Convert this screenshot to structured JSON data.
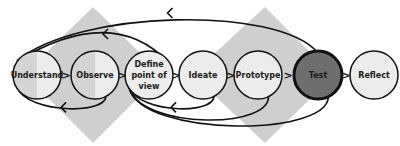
{
  "diagram": {
    "title": "",
    "steps": [
      {
        "id": "understand",
        "lines": [
          "Understand"
        ],
        "highlighted": false
      },
      {
        "id": "observe",
        "lines": [
          "Observe"
        ],
        "highlighted": false
      },
      {
        "id": "define",
        "lines": [
          "Define",
          "point of",
          "view"
        ],
        "highlighted": false
      },
      {
        "id": "ideate",
        "lines": [
          "Ideate"
        ],
        "highlighted": false
      },
      {
        "id": "prototype",
        "lines": [
          "Prototype"
        ],
        "highlighted": false
      },
      {
        "id": "test",
        "lines": [
          "Test"
        ],
        "highlighted": true
      },
      {
        "id": "reflect",
        "lines": [
          "Reflect"
        ],
        "highlighted": false
      }
    ],
    "separator_glyph": ">",
    "colors": {
      "diamond": "#cfcfcf",
      "circle_fill": "#ececec",
      "circle_shade": "#d4d4d4",
      "highlight_fill": "#6e6e6e",
      "stroke": "#111111"
    },
    "feedback_loops": [
      {
        "from": "test",
        "to": "understand",
        "side": "top"
      },
      {
        "from": "define",
        "to": "understand",
        "side": "top"
      },
      {
        "from": "observe",
        "to": "understand",
        "side": "bottom"
      },
      {
        "from": "ideate",
        "to": "define",
        "side": "bottom"
      },
      {
        "from": "prototype",
        "to": "define",
        "side": "bottom"
      },
      {
        "from": "test",
        "to": "define",
        "side": "bottom"
      }
    ]
  }
}
